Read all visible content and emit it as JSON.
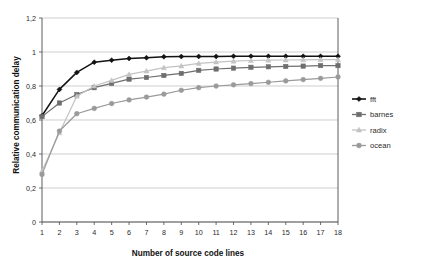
{
  "chart_data": {
    "type": "line",
    "title": "",
    "xlabel": "Number of source code lines",
    "ylabel": "Relative communication delay",
    "x": [
      1,
      2,
      3,
      4,
      5,
      6,
      7,
      8,
      9,
      10,
      11,
      12,
      13,
      14,
      15,
      16,
      17,
      18
    ],
    "xlim": [
      1,
      18
    ],
    "ylim": [
      0,
      1.2
    ],
    "grid": "horizontal",
    "legend_position": "right",
    "x_tick_labels": [
      "1",
      "2",
      "3",
      "4",
      "5",
      "6",
      "7",
      "8",
      "9",
      "10",
      "11",
      "12",
      "13",
      "14",
      "15",
      "16",
      "17",
      "18"
    ],
    "y_tick_labels": [
      "0",
      "0,2",
      "0,4",
      "0,6",
      "0,8",
      "1",
      "1,2"
    ],
    "y_tick_values": [
      0,
      0.2,
      0.4,
      0.6,
      0.8,
      1.0,
      1.2
    ],
    "decimal_separator": ",",
    "series": [
      {
        "name": "fft",
        "marker": "diamond",
        "color": "#131313",
        "values": [
          0.625,
          0.78,
          0.88,
          0.94,
          0.952,
          0.962,
          0.966,
          0.972,
          0.973,
          0.974,
          0.974,
          0.975,
          0.975,
          0.975,
          0.975,
          0.975,
          0.975,
          0.975
        ]
      },
      {
        "name": "barnes",
        "marker": "square",
        "color": "#6e6e6e",
        "values": [
          0.62,
          0.7,
          0.75,
          0.79,
          0.815,
          0.84,
          0.85,
          0.862,
          0.874,
          0.892,
          0.9,
          0.905,
          0.91,
          0.913,
          0.915,
          0.917,
          0.92,
          0.92
        ]
      },
      {
        "name": "radix",
        "marker": "triangle",
        "color": "#c3c3c3",
        "values": [
          0.3,
          0.525,
          0.74,
          0.8,
          0.833,
          0.868,
          0.888,
          0.908,
          0.918,
          0.933,
          0.941,
          0.946,
          0.95,
          0.952,
          0.953,
          0.954,
          0.955,
          0.955
        ]
      },
      {
        "name": "ocean",
        "marker": "circle",
        "color": "#9a9a9a",
        "values": [
          0.28,
          0.535,
          0.637,
          0.668,
          0.697,
          0.718,
          0.735,
          0.752,
          0.775,
          0.79,
          0.8,
          0.807,
          0.814,
          0.822,
          0.83,
          0.838,
          0.845,
          0.853
        ]
      }
    ],
    "legend": [
      {
        "label": "fft",
        "color": "#131313",
        "marker": "diamond"
      },
      {
        "label": "barnes",
        "color": "#6e6e6e",
        "marker": "square"
      },
      {
        "label": "radix",
        "color": "#c3c3c3",
        "marker": "triangle"
      },
      {
        "label": "ocean",
        "color": "#9a9a9a",
        "marker": "circle"
      }
    ]
  }
}
